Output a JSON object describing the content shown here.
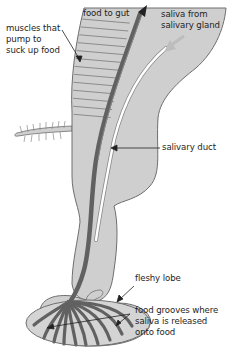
{
  "diagram": {
    "colors": {
      "body_fill": "#cfcfcf",
      "body_outline": "#6e6e6e",
      "food_canal": "#616161",
      "salivary_duct": "#ffffff",
      "muscle_lines": "#7a7a7a",
      "label_text": "#1e1e1e",
      "arrow": "#222222"
    },
    "labels": {
      "muscles": [
        "muscles that",
        "pump to",
        "suck up food"
      ],
      "food_to_gut": [
        "food to gut"
      ],
      "saliva_from_gland": [
        "saliva from",
        "salivary gland"
      ],
      "salivary_duct": [
        "salivary duct"
      ],
      "fleshy_lobe": [
        "fleshy lobe"
      ],
      "food_grooves": [
        "food grooves where",
        "saliva is released",
        "onto food"
      ]
    }
  }
}
